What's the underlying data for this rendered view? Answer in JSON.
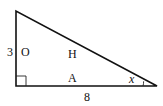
{
  "diagram": {
    "type": "right-triangle",
    "labels": {
      "side_left_length": "3",
      "side_left_name": "O",
      "hypotenuse_name": "H",
      "side_bottom_name": "A",
      "side_bottom_length": "8",
      "angle": "x"
    },
    "colors": {
      "stroke": "#111111",
      "background": "#ffffff"
    }
  }
}
